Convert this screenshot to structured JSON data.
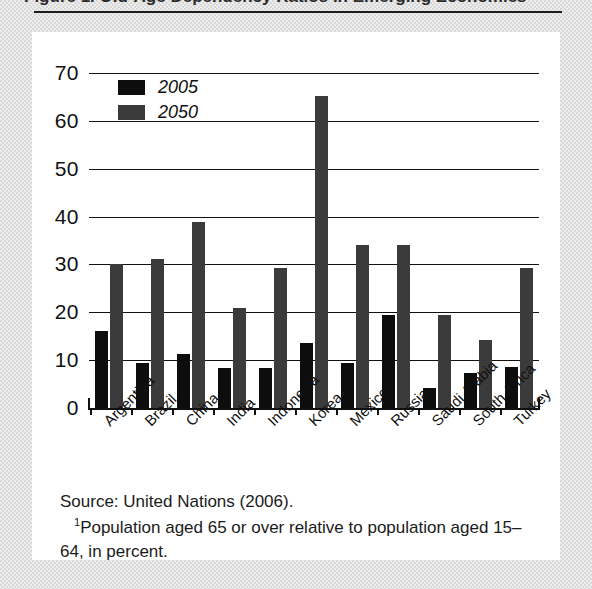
{
  "figure": {
    "title_clipped": "Figure 1. Old-Age Dependency Ratios in Emerging Economies",
    "source": "Source: United Nations (2006).",
    "footnote_marker": "1",
    "footnote": "Population aged 65 or over relative to population aged 15–64, in percent."
  },
  "colors": {
    "series_2005": "#0d0d0d",
    "series_2050": "#3b3b3b",
    "axis": "#111111",
    "panel_background": "#ffffff",
    "page_background": "#d8d8d8"
  },
  "chart_data": {
    "type": "bar",
    "title": "",
    "xlabel": "",
    "ylabel": "",
    "ylim": [
      0,
      70
    ],
    "yticks": [
      0,
      10,
      20,
      30,
      40,
      50,
      60,
      70
    ],
    "ytick_labels": [
      "0",
      "10",
      "20",
      "30",
      "40",
      "50",
      "60",
      "70"
    ],
    "grid": true,
    "grid_axis": "y",
    "legend_position": "upper-left",
    "categories": [
      "Argentina",
      "Brazil",
      "China",
      "India",
      "Indonesia",
      "Korea",
      "Mexico",
      "Russia",
      "Saudi Arabia",
      "South Africa",
      "Turkey"
    ],
    "series": [
      {
        "name": "2005",
        "color": "#0d0d0d",
        "values": [
          16.1,
          9.5,
          11.3,
          8.4,
          8.3,
          13.5,
          9.5,
          19.4,
          4.2,
          7.3,
          8.6
        ]
      },
      {
        "name": "2050",
        "color": "#3b3b3b",
        "values": [
          30.0,
          31.2,
          38.9,
          21.0,
          29.2,
          65.3,
          34.1,
          34.1,
          19.4,
          14.2,
          29.3
        ]
      }
    ]
  }
}
